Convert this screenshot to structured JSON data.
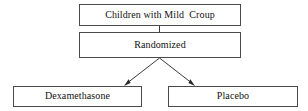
{
  "diagram": {
    "type": "flowchart",
    "title_text": "",
    "orientation": "top-down",
    "colors": {
      "background": "#ffffff",
      "box_border": "#4a4a4a",
      "box_fill": "#ffffff",
      "text": "#111111",
      "connector": "#3a3a3a"
    },
    "nodes": [
      {
        "id": "enrollment",
        "label": "Children with Mild  Croup",
        "role": "population"
      },
      {
        "id": "randomized",
        "label": "Randomized",
        "role": "allocation"
      },
      {
        "id": "arm-dexamethasone",
        "label": "Dexamethasone",
        "role": "treatment-arm"
      },
      {
        "id": "arm-placebo",
        "label": "Placebo",
        "role": "control-arm"
      }
    ],
    "connectors": [
      {
        "id": "enrollment-to-randomized",
        "from": "enrollment",
        "to": "randomized",
        "style": "plain-line"
      },
      {
        "id": "randomized-to-dexamethasone",
        "from": "randomized",
        "to": "arm-dexamethasone",
        "style": "arrow"
      },
      {
        "id": "randomized-to-placebo",
        "from": "randomized",
        "to": "arm-placebo",
        "style": "arrow"
      }
    ]
  }
}
